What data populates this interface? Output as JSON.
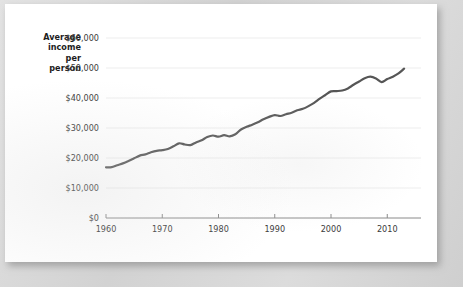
{
  "figure": {
    "background_color": "#d9d9d9",
    "page_color": "#ffffff"
  },
  "chart_data": {
    "type": "line",
    "title": "",
    "subtitle": "",
    "xlabel": "",
    "ylabel": "Average income per person",
    "ylabel_lines": [
      "Average",
      "income",
      "per",
      "person"
    ],
    "line_color": "#565656",
    "line_width": 2.2,
    "grid": true,
    "grid_color": "#ededed",
    "axis_color": "#8a8a8a",
    "legend": null,
    "legend_position": "none",
    "xlim": [
      1960,
      2016
    ],
    "ylim": [
      0,
      60000
    ],
    "xticks": [
      1960,
      1970,
      1980,
      1990,
      2000,
      2010
    ],
    "xtick_labels": [
      "1960",
      "1970",
      "1980",
      "1990",
      "2000",
      "2010"
    ],
    "yticks": [
      0,
      10000,
      20000,
      30000,
      40000,
      50000,
      60000
    ],
    "ytick_labels": [
      "$0",
      "$10,000",
      "$20,000",
      "$30,000",
      "$40,000",
      "$50,000",
      "$60,000"
    ],
    "series": [
      {
        "name": "Average income per person",
        "x": [
          1960,
          1961,
          1962,
          1963,
          1964,
          1965,
          1966,
          1967,
          1968,
          1969,
          1970,
          1971,
          1972,
          1973,
          1974,
          1975,
          1976,
          1977,
          1978,
          1979,
          1980,
          1981,
          1982,
          1983,
          1984,
          1985,
          1986,
          1987,
          1988,
          1989,
          1990,
          1991,
          1992,
          1993,
          1994,
          1995,
          1996,
          1997,
          1998,
          1999,
          2000,
          2001,
          2002,
          2003,
          2004,
          2005,
          2006,
          2007,
          2008,
          2009,
          2010,
          2011,
          2012,
          2013
        ],
        "values": [
          16900,
          16950,
          17600,
          18200,
          19000,
          19900,
          20800,
          21200,
          21900,
          22400,
          22600,
          23000,
          23900,
          24900,
          24500,
          24300,
          25200,
          25900,
          27000,
          27500,
          27100,
          27600,
          27200,
          27900,
          29500,
          30400,
          31100,
          31900,
          32900,
          33700,
          34300,
          34000,
          34600,
          35100,
          35900,
          36400,
          37300,
          38400,
          39800,
          41000,
          42200,
          42300,
          42500,
          43200,
          44400,
          45500,
          46600,
          47100,
          46500,
          45300,
          46300,
          47100,
          48200,
          49800
        ]
      }
    ]
  },
  "axis_labels": {
    "ylabel_line1": "Average",
    "ylabel_line2": "income",
    "ylabel_line3": "per",
    "ylabel_line4": "person"
  }
}
